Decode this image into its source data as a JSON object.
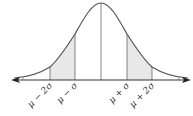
{
  "diagram": {
    "type": "normal-distribution-curve",
    "colors": {
      "curve": "#555555",
      "axis": "#333333",
      "shade": "#e8e8e8",
      "lines": "#666666"
    },
    "labels": {
      "mu_minus_2sigma": "μ − 2σ",
      "mu_minus_sigma": "μ − σ",
      "mu_plus_sigma": "μ + σ",
      "mu_plus_2sigma": "μ + 2σ"
    },
    "shaded_regions": [
      "μ−2σ to μ−σ",
      "μ+σ to μ+2σ"
    ]
  }
}
